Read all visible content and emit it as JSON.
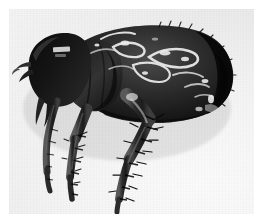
{
  "document": {
    "kind": "photomicrograph",
    "modality": "black-and-white photograph",
    "subject_common_name": "flea",
    "view": "lateral (side) view",
    "caption": "",
    "title": "",
    "alt_text": "Black and white photomicrograph of a flea shown in lateral view, body facing left, with a dark sclerotized body, long spiny hind legs and bright specular highlights on the abdomen."
  },
  "canvas": {
    "width": 262,
    "height": 224,
    "page_background": "#ffffff"
  },
  "photo": {
    "x": 9,
    "y": 9,
    "width": 245,
    "height": 205,
    "background_light": "#fbfbfb",
    "background_mid": "#ededed",
    "background_dark": "#e2e2e2",
    "border": "none",
    "has_visible_frame": false
  },
  "specimen": {
    "body_color_dark": "#101010",
    "body_color_mid": "#2a2a2a",
    "body_color_light": "#4a4a4a",
    "highlight_color": "#f2f2f2",
    "orientation": "head at left, abdomen at right, legs pointing down",
    "parts": [
      {
        "id": "head",
        "label": "head",
        "note": "rounded, darkest, at upper left"
      },
      {
        "id": "antenna",
        "label": "antenna / maxillary palp",
        "note": "small pale projection at far left edge of head"
      },
      {
        "id": "mouthparts",
        "label": "mouthparts",
        "note": "below head, pointing down-left"
      },
      {
        "id": "thorax",
        "label": "thorax",
        "note": "between head and abdomen, bears the legs"
      },
      {
        "id": "abdomen",
        "label": "abdomen",
        "note": "large dark oval with bright specular highlights, occupies right two-thirds"
      },
      {
        "id": "foreleg",
        "label": "foreleg",
        "note": "slender, angled down-left"
      },
      {
        "id": "midleg",
        "label": "midleg",
        "note": "central, bristled"
      },
      {
        "id": "hindleg",
        "label": "hind leg",
        "note": "longest, heavily bristled, extends to lower centre"
      },
      {
        "id": "bristles",
        "label": "bristles / setae",
        "note": "short dark spines along tibiae and tarsi"
      },
      {
        "id": "highlights",
        "label": "specular highlights",
        "note": "irregular bright white streaks across the abdomen cuticle"
      }
    ]
  },
  "margins": {
    "left": 9,
    "top": 9,
    "right": 8,
    "bottom": 10
  }
}
